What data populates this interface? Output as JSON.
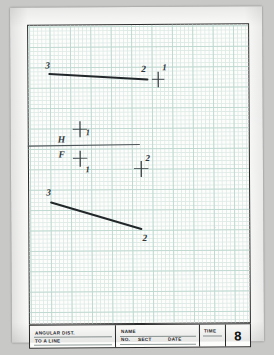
{
  "document": {
    "kind": "engineering-graph-worksheet",
    "sheet_number": "8",
    "paper_color": "#fdfdfc",
    "grid_color": "#bcd8cf",
    "ink_color": "#32383a",
    "frame_color": "#2a2a2a"
  },
  "title_block": {
    "description_line1": "ANGULAR DIST.",
    "description_line2": "TO A LINE",
    "name_label": "NAME",
    "no_label": "NO.",
    "sect_label": "SECT",
    "date_label": "DATE",
    "time_label": "TIME",
    "sheet_number": "8"
  },
  "drawing": {
    "fold_line": {
      "upper_label": "H",
      "lower_label": "F"
    },
    "top_line": {
      "start_label": "3",
      "end_label": "2"
    },
    "bottom_line": {
      "start_label": "3",
      "end_label": "2"
    },
    "points": [
      {
        "label": "1",
        "view": "horizontal-upper-right"
      },
      {
        "label": "1",
        "view": "horizontal-above-fold"
      },
      {
        "label": "1",
        "view": "frontal-below-fold"
      },
      {
        "label": "2",
        "view": "frontal-right"
      }
    ]
  }
}
